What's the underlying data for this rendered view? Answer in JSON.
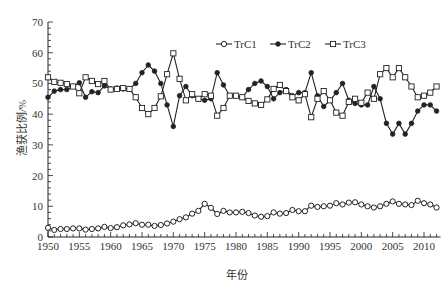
{
  "chart_data": {
    "type": "line",
    "title": "",
    "xlabel": "年份",
    "ylabel": "渔获比例/%",
    "xlim": [
      1950,
      2012
    ],
    "ylim": [
      0,
      70
    ],
    "xticks": [
      1950,
      1955,
      1960,
      1965,
      1970,
      1975,
      1980,
      1985,
      1990,
      1995,
      2000,
      2005,
      2010
    ],
    "yticks": [
      0,
      10,
      20,
      30,
      40,
      50,
      60,
      70
    ],
    "grid": false,
    "legend_position": "top-right",
    "x": [
      1950,
      1951,
      1952,
      1953,
      1954,
      1955,
      1956,
      1957,
      1958,
      1959,
      1960,
      1961,
      1962,
      1963,
      1964,
      1965,
      1966,
      1967,
      1968,
      1969,
      1970,
      1971,
      1972,
      1973,
      1974,
      1975,
      1976,
      1977,
      1978,
      1979,
      1980,
      1981,
      1982,
      1983,
      1984,
      1985,
      1986,
      1987,
      1988,
      1989,
      1990,
      1991,
      1992,
      1993,
      1994,
      1995,
      1996,
      1997,
      1998,
      1999,
      2000,
      2001,
      2002,
      2003,
      2004,
      2005,
      2006,
      2007,
      2008,
      2009,
      2010,
      2011,
      2012
    ],
    "series": [
      {
        "name": "TrC1",
        "marker": "circle-open",
        "values": [
          3,
          2.3,
          2.6,
          2.6,
          2.8,
          2.8,
          2.4,
          2.6,
          2.8,
          3.3,
          2.9,
          3.2,
          3.8,
          4.1,
          4.5,
          4,
          4,
          3.6,
          3.9,
          4.4,
          5,
          5.8,
          6.4,
          7.6,
          8.5,
          10.8,
          9.5,
          7.5,
          8.5,
          8,
          8,
          8.2,
          7.8,
          7,
          6.6,
          6.8,
          8,
          7.6,
          7.8,
          8.8,
          8.4,
          8.4,
          10.2,
          9.8,
          10,
          10.2,
          11,
          10.6,
          11.2,
          11.3,
          10.6,
          10,
          9.6,
          10,
          10.8,
          11.6,
          10.8,
          10.6,
          10.4,
          11.8,
          11,
          10.6,
          9.6
        ]
      },
      {
        "name": "TrC2",
        "marker": "circle-filled",
        "values": [
          45.5,
          47.5,
          48,
          48,
          49,
          50.2,
          45.5,
          47.3,
          47,
          49.2,
          48.2,
          48.5,
          48.2,
          48.2,
          50,
          53.5,
          56,
          54,
          50,
          43,
          36,
          46,
          49,
          46,
          45,
          44.5,
          45,
          53.5,
          49.5,
          46,
          46,
          45.5,
          48,
          50,
          50.8,
          49,
          45,
          47,
          48,
          46,
          47,
          47,
          53.5,
          46,
          42.5,
          44.5,
          47,
          50,
          44.5,
          43.5,
          43,
          43,
          49,
          45,
          37,
          33.5,
          37,
          33.5,
          37,
          41,
          43,
          43,
          41
        ]
      },
      {
        "name": "TrC3",
        "marker": "square-open",
        "values": [
          52,
          50.5,
          50.2,
          49.8,
          49,
          46.8,
          52,
          50.8,
          49.8,
          50.8,
          48,
          48.2,
          48.5,
          48.2,
          45.5,
          42,
          40,
          42,
          45.8,
          53,
          59.8,
          51.5,
          44.5,
          46.5,
          45,
          46.5,
          46,
          39.5,
          42,
          46,
          46,
          45.5,
          44.3,
          43.5,
          43,
          44.8,
          48.2,
          49.5,
          47.5,
          45.5,
          44.5,
          46.5,
          39,
          45,
          47.5,
          44.5,
          40.5,
          39.5,
          44,
          45,
          43.7,
          47,
          45,
          53,
          55,
          52,
          55,
          52,
          49,
          45.5,
          46,
          47,
          49
        ]
      }
    ]
  },
  "legend": {
    "items": [
      "TrC1",
      "TrC2",
      "TrC3"
    ]
  },
  "axes": {
    "xlabel": "年份",
    "ylabel": "渔获比例/%"
  }
}
